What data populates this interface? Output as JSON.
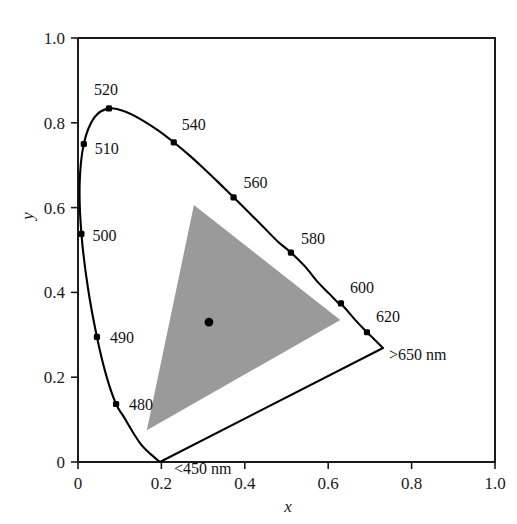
{
  "figure": {
    "xlabel": "x",
    "ylabel": "y",
    "locus_color": "#000000",
    "gamut_fill": "#9a9a9a",
    "background": "#ffffff"
  },
  "axes": {
    "x_ticks": [
      "0",
      "0.2",
      "0.4",
      "0.6",
      "0.8",
      "1.0"
    ],
    "y_ticks": [
      "0",
      "0.2",
      "0.4",
      "0.6",
      "0.8",
      "1.0"
    ],
    "x_values": [
      0,
      0.2,
      0.4,
      0.6,
      0.8,
      1.0
    ],
    "y_values": [
      0,
      0.2,
      0.4,
      0.6,
      0.8,
      1.0
    ],
    "xlim": [
      0,
      1.0
    ],
    "ylim": [
      0,
      1.0
    ]
  },
  "chart_data": {
    "type": "scatter",
    "title": "",
    "xlabel": "x",
    "ylabel": "y",
    "xlim": [
      0,
      1.0
    ],
    "ylim": [
      0,
      1.0
    ],
    "grid": false,
    "legend": "none",
    "spectral_locus": {
      "name": "Spectral locus",
      "points": [
        {
          "label": "<450 nm",
          "wavelength": 450,
          "x": 0.1965,
          "y": 0.0,
          "labeled": true,
          "marker": false
        },
        {
          "label": "480",
          "wavelength": 480,
          "x": 0.0913,
          "y": 0.1368,
          "labeled": true,
          "marker": true
        },
        {
          "label": "490",
          "wavelength": 490,
          "x": 0.0454,
          "y": 0.295,
          "labeled": true,
          "marker": true
        },
        {
          "label": "500",
          "wavelength": 500,
          "x": 0.0082,
          "y": 0.538,
          "labeled": true,
          "marker": true
        },
        {
          "label": "510",
          "wavelength": 510,
          "x": 0.0139,
          "y": 0.75,
          "labeled": true,
          "marker": true
        },
        {
          "label": "520",
          "wavelength": 520,
          "x": 0.0743,
          "y": 0.834,
          "labeled": true,
          "marker": true
        },
        {
          "label": "540",
          "wavelength": 540,
          "x": 0.2296,
          "y": 0.754,
          "labeled": true,
          "marker": true
        },
        {
          "label": "560",
          "wavelength": 560,
          "x": 0.3731,
          "y": 0.624,
          "labeled": true,
          "marker": true
        },
        {
          "label": "580",
          "wavelength": 580,
          "x": 0.5106,
          "y": 0.494,
          "labeled": true,
          "marker": true
        },
        {
          "label": "600",
          "wavelength": 600,
          "x": 0.6306,
          "y": 0.374,
          "labeled": true,
          "marker": true
        },
        {
          "label": "620",
          "wavelength": 620,
          "x": 0.6929,
          "y": 0.306,
          "labeled": true,
          "marker": true
        },
        {
          "label": ">650 nm",
          "wavelength": 650,
          "x": 0.7314,
          "y": 0.2689,
          "labeled": true,
          "marker": false
        }
      ]
    },
    "gamut_triangle": {
      "name": "Display gamut",
      "fill": "#9a9a9a",
      "vertices": [
        {
          "name": "green-primary",
          "x": 0.278,
          "y": 0.606
        },
        {
          "name": "red-primary",
          "x": 0.629,
          "y": 0.335
        },
        {
          "name": "blue-primary",
          "x": 0.165,
          "y": 0.075
        }
      ]
    },
    "white_point": {
      "name": "white-point",
      "x": 0.314,
      "y": 0.33,
      "marker": "dot"
    }
  }
}
